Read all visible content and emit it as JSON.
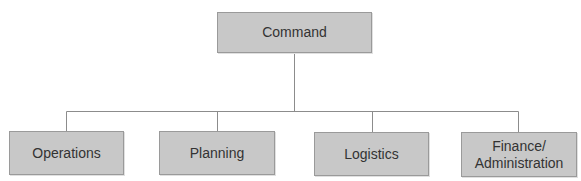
{
  "diagram": {
    "type": "org-chart",
    "root": {
      "label": "Command"
    },
    "children": [
      {
        "label": "Operations"
      },
      {
        "label": "Planning"
      },
      {
        "label": "Logistics"
      },
      {
        "label": "Finance/\nAdministration"
      }
    ],
    "colors": {
      "box_fill": "#c8c8c8",
      "box_border": "#9a9a9a",
      "connector": "#8c8c8c",
      "text": "#333333"
    }
  }
}
